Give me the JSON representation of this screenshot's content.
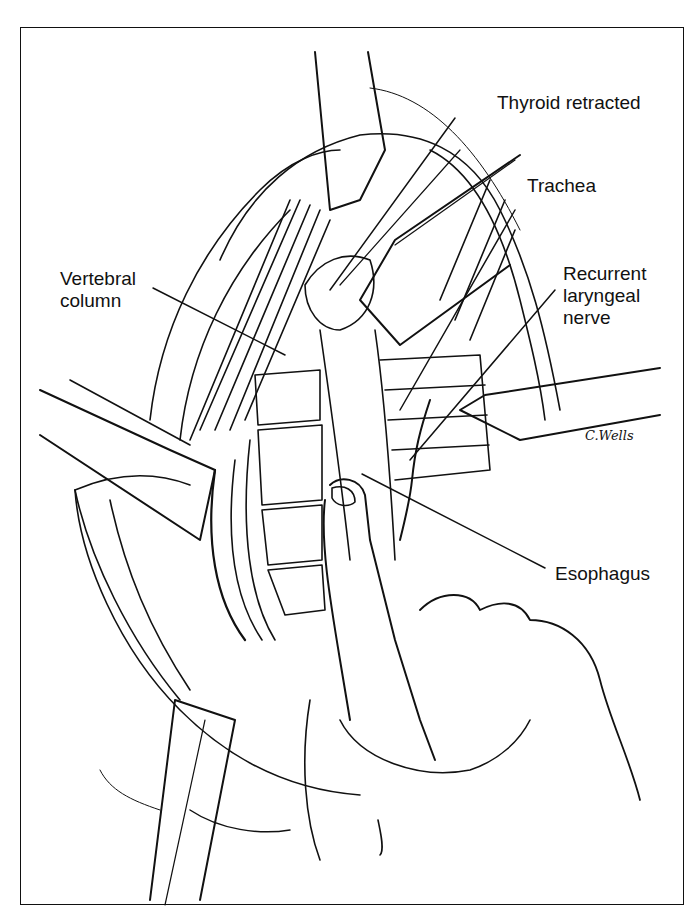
{
  "figure": {
    "type": "surgical line illustration",
    "labels": {
      "thyroid": "Thyroid retracted",
      "trachea": "Trachea",
      "nerve_line1": "Recurrent",
      "nerve_line2": "laryngeal",
      "nerve_line3": "nerve",
      "vertebral_line1": "Vertebral",
      "vertebral_line2": "column",
      "esophagus": "Esophagus"
    },
    "signature": "C.Wells",
    "colors": {
      "ink": "#111111",
      "paper": "#ffffff"
    }
  }
}
